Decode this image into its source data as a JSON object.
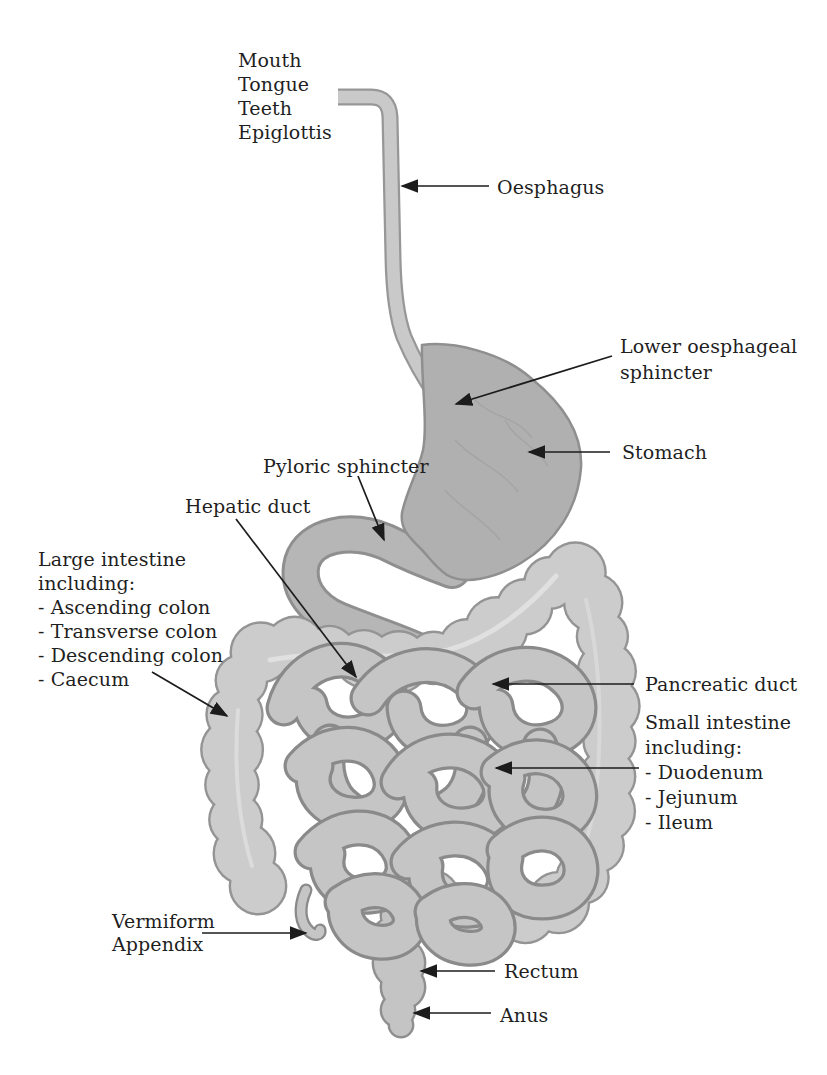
{
  "figure_type": "digestive-system-diagram",
  "labels": {
    "mouth_group": {
      "lines": [
        "Mouth",
        "Tongue",
        "Teeth",
        "Epiglottis"
      ]
    },
    "oesphagus": {
      "text": "Oesphagus"
    },
    "lower_oesphageal_sphincter": {
      "lines": [
        "Lower oesphageal",
        "sphincter"
      ]
    },
    "stomach": {
      "text": "Stomach"
    },
    "pyloric_sphincter": {
      "text": "Pyloric sphincter"
    },
    "hepatic_duct": {
      "text": "Hepatic duct"
    },
    "large_intestine": {
      "lines": [
        "Large intestine",
        "including:",
        "- Ascending colon",
        "- Transverse colon",
        "- Descending colon",
        "- Caecum"
      ]
    },
    "pancreatic_duct": {
      "text": "Pancreatic duct"
    },
    "small_intestine": {
      "lines": [
        "Small intestine",
        "including:",
        "- Duodenum",
        "- Jejunum",
        "- Ileum"
      ]
    },
    "vermiform_appendix": {
      "lines": [
        "Vermiform",
        "Appendix"
      ]
    },
    "rectum": {
      "text": "Rectum"
    },
    "anus": {
      "text": "Anus"
    }
  },
  "colors": {
    "background": "#ffffff",
    "label_text": "#1f1f1f",
    "arrow": "#1c1c1c",
    "esophagus_fill": "#c9c9c9",
    "esophagus_edge": "#979797",
    "stomach_fill": "#b0b0b0",
    "stomach_edge": "#8f8f8f",
    "stomach_vein": "#9c9c9c",
    "duodenum_fill": "#b6b6b6",
    "duodenum_edge": "#8f8f8f",
    "colon_fill": "#cccccc",
    "colon_edge": "#949494",
    "coil_fill": "#c5c5c5",
    "coil_edge": "#8a8a8a",
    "rectum_fill": "#c4c4c4",
    "rectum_edge": "#8f8f8f",
    "highlight": "#ebebeb"
  }
}
